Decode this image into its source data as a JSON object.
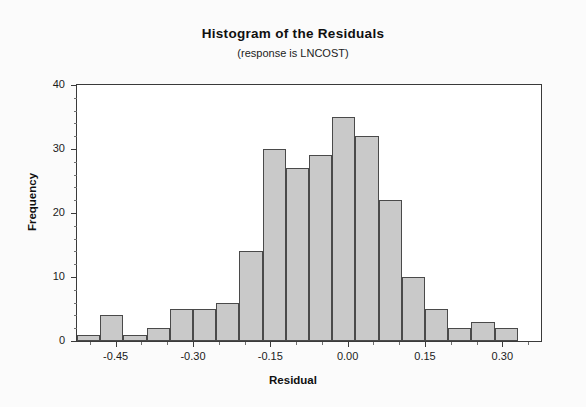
{
  "chart_data": {
    "type": "bar",
    "title": "Histogram of the Residuals",
    "subtitle": "(response is LNCOST)",
    "xlabel": "Residual",
    "ylabel": "Frequency",
    "grid": false,
    "legend": "none",
    "xlim": [
      -0.525,
      0.375
    ],
    "ylim": [
      0,
      40
    ],
    "yticks": [
      0,
      10,
      20,
      30,
      40
    ],
    "ytick_labels": [
      "0",
      "10",
      "20",
      "30",
      "40"
    ],
    "xticks": [
      -0.45,
      -0.3,
      -0.15,
      0.0,
      0.15,
      0.3
    ],
    "xtick_labels": [
      "-0.45",
      "-0.30",
      "-0.15",
      "0.00",
      "0.15",
      "0.30"
    ],
    "bin_width": 0.045,
    "bin_starts": [
      -0.525,
      -0.48,
      -0.435,
      -0.39,
      -0.345,
      -0.3,
      -0.255,
      -0.21,
      -0.165,
      -0.12,
      -0.075,
      -0.03,
      0.015,
      0.06,
      0.105,
      0.15,
      0.195,
      0.24,
      0.285,
      0.33
    ],
    "bin_centers": [
      -0.5025,
      -0.4575,
      -0.4125,
      -0.3675,
      -0.3225,
      -0.2775,
      -0.2325,
      -0.1875,
      -0.1425,
      -0.0975,
      -0.0525,
      -0.0075,
      0.0375,
      0.0825,
      0.1275,
      0.1725,
      0.2175,
      0.2625,
      0.3075,
      0.3525
    ],
    "values": [
      1,
      4,
      1,
      2,
      5,
      5,
      6,
      14,
      30,
      27,
      29,
      35,
      32,
      22,
      10,
      5,
      2,
      3,
      2,
      0
    ],
    "categories": [
      "-0.50",
      "-0.46",
      "-0.41",
      "-0.37",
      "-0.32",
      "-0.28",
      "-0.23",
      "-0.19",
      "-0.14",
      "-0.10",
      "-0.05",
      "-0.01",
      "0.04",
      "0.08",
      "0.13",
      "0.17",
      "0.22",
      "0.26",
      "0.31",
      "0.35"
    ],
    "bar_color": "#c9c9c9",
    "bar_edge_color": "#4a4a4a",
    "plot_bg": "#ffffff",
    "frame_color": "#3a3a3a"
  }
}
